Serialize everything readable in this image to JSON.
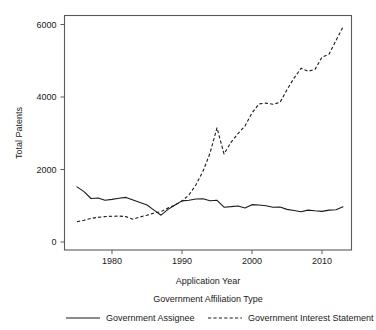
{
  "chart_data": {
    "type": "line",
    "title": "",
    "xlabel": "Application Year",
    "ylabel": "Total Patents",
    "xlim": [
      1974,
      2014
    ],
    "ylim": [
      0,
      6400
    ],
    "xticks": [
      1980,
      1990,
      2000,
      2010
    ],
    "xticklabels": [
      "1980",
      "1990",
      "2000",
      "2010"
    ],
    "yticks": [
      0,
      2000,
      4000,
      6000
    ],
    "yticklabels": [
      "0",
      "2000",
      "4000",
      "6000"
    ],
    "grid": false,
    "legend": {
      "title": "Government Affiliation Type",
      "position": "below",
      "entries": [
        {
          "label": "Government Assignee",
          "style": "solid"
        },
        {
          "label": "Government Interest Statement",
          "style": "dashed"
        }
      ]
    },
    "x": [
      1975,
      1976,
      1977,
      1978,
      1979,
      1980,
      1981,
      1982,
      1983,
      1984,
      1985,
      1986,
      1987,
      1988,
      1989,
      1990,
      1991,
      1992,
      1993,
      1994,
      1995,
      1996,
      1997,
      1998,
      1999,
      2000,
      2001,
      2002,
      2003,
      2004,
      2005,
      2006,
      2007,
      2008,
      2009,
      2010,
      2011,
      2012,
      2013
    ],
    "series": [
      {
        "name": "Government Assignee",
        "style": "solid",
        "values": [
          1520,
          1390,
          1200,
          1215,
          1150,
          1175,
          1205,
          1230,
          1160,
          1090,
          1020,
          880,
          740,
          900,
          1020,
          1135,
          1150,
          1185,
          1195,
          1140,
          1150,
          960,
          975,
          995,
          940,
          1030,
          1020,
          1000,
          960,
          965,
          900,
          870,
          835,
          880,
          860,
          845,
          880,
          890,
          970
        ]
      },
      {
        "name": "Government Interest Statement",
        "style": "dashed",
        "values": [
          560,
          600,
          650,
          680,
          700,
          710,
          715,
          700,
          630,
          690,
          740,
          800,
          840,
          940,
          1020,
          1130,
          1300,
          1580,
          1950,
          2450,
          3150,
          2430,
          2750,
          2990,
          3200,
          3560,
          3810,
          3830,
          3800,
          3850,
          4200,
          4520,
          4790,
          4710,
          4760,
          5100,
          5180,
          5560,
          5930
        ]
      }
    ]
  }
}
